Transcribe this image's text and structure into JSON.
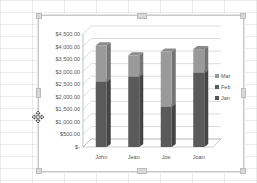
{
  "chart_data": {
    "type": "bar",
    "subtype": "stacked-3d-column",
    "title": "",
    "xlabel": "",
    "ylabel": "",
    "categories": [
      "John",
      "Jean",
      "Joe",
      "Joan"
    ],
    "series": [
      {
        "name": "Jan",
        "color": "#555555",
        "values": [
          0,
          0,
          0,
          0
        ]
      },
      {
        "name": "Feb",
        "color": "#5a5a5a",
        "values": [
          2600,
          2800,
          1600,
          2950
        ]
      },
      {
        "name": "Mar",
        "color": "#9a9a9a",
        "values": [
          1450,
          850,
          2200,
          950
        ]
      }
    ],
    "ylim": [
      0,
      4500
    ],
    "yticks": [
      "$-",
      "$500.00",
      "$1,000.00",
      "$1,500.00",
      "$2,000.00",
      "$2,500.00",
      "$3,000.00",
      "$3,500.00",
      "$4,000.00",
      "$4,500.00"
    ],
    "grid": true,
    "legend": {
      "position": "right",
      "entries": [
        "Mar",
        "Feb",
        "Jan"
      ]
    }
  }
}
